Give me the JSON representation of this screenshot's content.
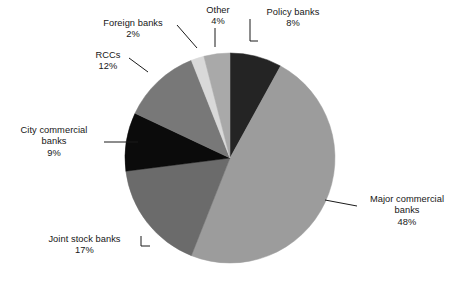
{
  "chart_data": {
    "type": "pie",
    "title": "",
    "subtitle": "",
    "xlabel": "",
    "ylabel": "",
    "grid": false,
    "legend_position": "none",
    "labels_outside_with_leader_lines": true,
    "start_angle_deg": 0,
    "direction": "clockwise",
    "units": "percent",
    "total": 100,
    "categories": [
      "Policy banks",
      "Major commercial banks",
      "Joint stock banks",
      "City commercial banks",
      "RCCs",
      "Foreign banks",
      "Other"
    ],
    "values": [
      8,
      48,
      17,
      9,
      12,
      2,
      4
    ],
    "slices": [
      {
        "name": "Policy banks",
        "value": 8,
        "pct_label": "8%",
        "color": "#242424",
        "start_deg": 0,
        "end_deg": 28.8
      },
      {
        "name": "Major commercial banks",
        "value": 48,
        "pct_label": "48%",
        "color": "#9c9c9c",
        "start_deg": 28.8,
        "end_deg": 201.6
      },
      {
        "name": "Joint stock banks",
        "value": 17,
        "pct_label": "17%",
        "color": "#6b6b6b",
        "start_deg": 201.6,
        "end_deg": 262.8
      },
      {
        "name": "City commercial banks",
        "value": 9,
        "pct_label": "9%",
        "color": "#0b0b0b",
        "start_deg": 262.8,
        "end_deg": 295.2
      },
      {
        "name": "RCCs",
        "value": 12,
        "pct_label": "12%",
        "color": "#787878",
        "start_deg": 295.2,
        "end_deg": 338.4
      },
      {
        "name": "Foreign banks",
        "value": 2,
        "pct_label": "2%",
        "color": "#d9d9d9",
        "start_deg": 338.4,
        "end_deg": 345.6
      },
      {
        "name": "Other",
        "value": 4,
        "pct_label": "4%",
        "color": "#a9a9a9",
        "start_deg": 345.6,
        "end_deg": 360
      }
    ]
  },
  "labels": {
    "policy": {
      "name": "Policy banks",
      "pct": "8%"
    },
    "major": {
      "name_line1": "Major commercial",
      "name_line2": "banks",
      "pct": "48%"
    },
    "joint": {
      "name": "Joint stock banks",
      "pct": "17%"
    },
    "city": {
      "name_line1": "City commercial",
      "name_line2": "banks",
      "pct": "9%"
    },
    "rccs": {
      "name": "RCCs",
      "pct": "12%"
    },
    "foreign": {
      "name": "Foreign banks",
      "pct": "2%"
    },
    "other": {
      "name": "Other",
      "pct": "4%"
    }
  },
  "colors": {
    "background": "#ffffff",
    "text": "#161616",
    "leader_line": "#1a1a1a"
  }
}
